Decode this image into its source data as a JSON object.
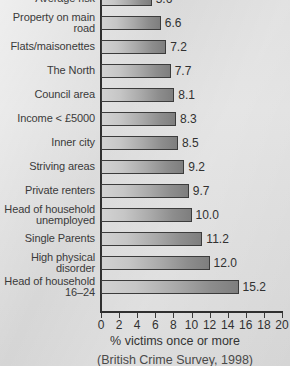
{
  "chart_data": {
    "type": "bar",
    "orientation": "horizontal",
    "title": "",
    "xlabel": "% victims once or more",
    "ylabel": "",
    "xlim": [
      0,
      20
    ],
    "xticks": [
      0,
      2,
      4,
      6,
      8,
      10,
      12,
      14,
      16,
      18,
      20
    ],
    "grid": false,
    "legend": null,
    "source_note": "(British Crime Survey, 1998)",
    "categories": [
      "Average risk",
      "Property on main\nroad",
      "Flats/maisonettes",
      "The North",
      "Council area",
      "Income < £5000",
      "Inner city",
      "Striving areas",
      "Private renters",
      "Head of household\nunemployed",
      "Single Parents",
      "High physical\ndisorder",
      "Head of household\n16–24"
    ],
    "values": [
      5.6,
      6.6,
      7.2,
      7.7,
      8.1,
      8.3,
      8.5,
      9.2,
      9.7,
      10.0,
      11.2,
      12.0,
      15.2
    ],
    "value_labels": [
      "5.6",
      "6.6",
      "7.2",
      "7.7",
      "8.1",
      "8.3",
      "8.5",
      "9.2",
      "9.7",
      "10.0",
      "11.2",
      "12.0",
      "15.2"
    ]
  },
  "colors": {
    "background": "#dcdcdc",
    "axis": "#2f2f2f",
    "bar_light": "#d2d2d2",
    "bar_dark": "#7e7e7e",
    "bar_border": "#3c3c3c",
    "text": "#313131"
  }
}
